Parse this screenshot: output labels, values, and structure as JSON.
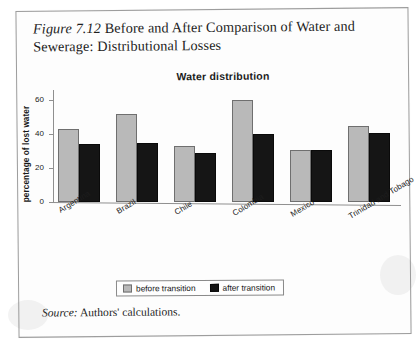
{
  "figure": {
    "number_label": "Figure 7.12",
    "caption": " Before and After Comparison of Water and Sewerage: Distributional Losses",
    "source_label": "Source:",
    "source_text": " Authors' calculations."
  },
  "legend": {
    "before_label": "before transition",
    "after_label": "after transition"
  },
  "colors": {
    "before_fill": "#b9b9b9",
    "after_fill": "#151515",
    "axis": "#8f8f8f",
    "page_border": "#9d9d9d"
  },
  "chart_data": {
    "type": "bar",
    "title": "Water distribution",
    "xlabel": "",
    "ylabel": "percentage of lost water",
    "ylim": [
      0,
      65
    ],
    "yticks": [
      0,
      20,
      40,
      60
    ],
    "ytick_labels": [
      "0",
      "20",
      "40",
      "60"
    ],
    "grid": false,
    "legend_position": "bottom-center",
    "categories": [
      "Argentina",
      "Brazil",
      "Chile",
      "Colombia",
      "Mexico",
      "Trinidad and Tobago"
    ],
    "series": [
      {
        "name": "before transition",
        "color": "#b9b9b9",
        "values": [
          43,
          52,
          33,
          60,
          31,
          45
        ]
      },
      {
        "name": "after transition",
        "color": "#151515",
        "values": [
          34,
          35,
          29,
          40,
          31,
          41
        ]
      }
    ]
  }
}
